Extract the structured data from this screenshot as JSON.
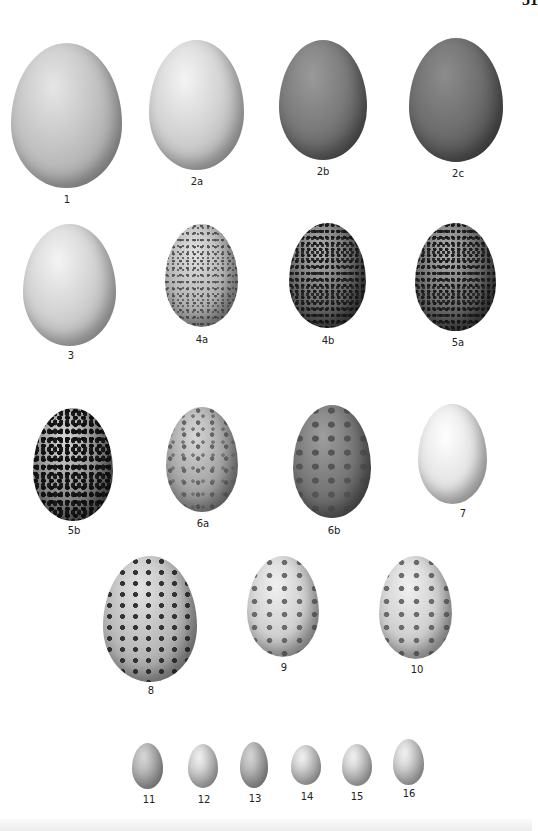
{
  "page": {
    "number": "51"
  },
  "plate": {
    "eggs": [
      {
        "label": "1",
        "left": 11,
        "top": 43,
        "width": 111,
        "height": 145,
        "style": "plain-mid"
      },
      {
        "label": "2a",
        "left": 149,
        "top": 40,
        "width": 95,
        "height": 130,
        "style": "plain-light"
      },
      {
        "label": "2b",
        "left": 279,
        "top": 40,
        "width": 88,
        "height": 120,
        "style": "plain-dark"
      },
      {
        "label": "2c",
        "left": 409,
        "top": 38,
        "width": 94,
        "height": 124,
        "style": "plain-darker"
      },
      {
        "label": "3",
        "left": 23,
        "top": 224,
        "width": 93,
        "height": 122,
        "style": "plain-light"
      },
      {
        "label": "4a",
        "left": 165,
        "top": 224,
        "width": 73,
        "height": 103,
        "style": "speckle-light"
      },
      {
        "label": "4b",
        "left": 289,
        "top": 223,
        "width": 77,
        "height": 105,
        "style": "speckle-dark"
      },
      {
        "label": "5a",
        "left": 415,
        "top": 223,
        "width": 81,
        "height": 108,
        "style": "speckle-dark"
      },
      {
        "label": "5b",
        "left": 33,
        "top": 408,
        "width": 80,
        "height": 113,
        "style": "blotch-dark"
      },
      {
        "label": "6a",
        "left": 166,
        "top": 407,
        "width": 72,
        "height": 105,
        "style": "spotted-mid"
      },
      {
        "label": "6b",
        "left": 293,
        "top": 405,
        "width": 78,
        "height": 113,
        "style": "mottled-dark"
      },
      {
        "label": "7",
        "left": 418,
        "top": 404,
        "width": 69,
        "height": 100,
        "style": "plain-white"
      },
      {
        "label": "8",
        "left": 103,
        "top": 556,
        "width": 94,
        "height": 126,
        "style": "blotch-large"
      },
      {
        "label": "9",
        "left": 247,
        "top": 556,
        "width": 72,
        "height": 101,
        "style": "blotch-pale"
      },
      {
        "label": "10",
        "left": 379,
        "top": 556,
        "width": 73,
        "height": 103,
        "style": "blotch-pale"
      },
      {
        "label": "11",
        "left": 132,
        "top": 743,
        "width": 31,
        "height": 46,
        "style": "small-egg darker"
      },
      {
        "label": "12",
        "left": 188,
        "top": 744,
        "width": 30,
        "height": 44,
        "style": "small-egg"
      },
      {
        "label": "13",
        "left": 240,
        "top": 742,
        "width": 28,
        "height": 46,
        "style": "small-egg darker"
      },
      {
        "label": "14",
        "left": 291,
        "top": 745,
        "width": 30,
        "height": 40,
        "style": "small-egg"
      },
      {
        "label": "15",
        "left": 342,
        "top": 744,
        "width": 30,
        "height": 42,
        "style": "small-egg"
      },
      {
        "label": "16",
        "left": 393,
        "top": 739,
        "width": 31,
        "height": 46,
        "style": "small-egg"
      }
    ],
    "labels": [
      {
        "text": "1",
        "x": 67,
        "y": 194
      },
      {
        "text": "2a",
        "x": 197,
        "y": 176
      },
      {
        "text": "2b",
        "x": 323,
        "y": 166
      },
      {
        "text": "2c",
        "x": 458,
        "y": 168
      },
      {
        "text": "3",
        "x": 71,
        "y": 350
      },
      {
        "text": "4a",
        "x": 202,
        "y": 334
      },
      {
        "text": "4b",
        "x": 328,
        "y": 335
      },
      {
        "text": "5a",
        "x": 458,
        "y": 337
      },
      {
        "text": "5b",
        "x": 74,
        "y": 525
      },
      {
        "text": "6a",
        "x": 203,
        "y": 518
      },
      {
        "text": "6b",
        "x": 334,
        "y": 525
      },
      {
        "text": "7",
        "x": 463,
        "y": 508
      },
      {
        "text": "8",
        "x": 151,
        "y": 685
      },
      {
        "text": "9",
        "x": 284,
        "y": 662
      },
      {
        "text": "10",
        "x": 417,
        "y": 664
      },
      {
        "text": "11",
        "x": 149,
        "y": 794
      },
      {
        "text": "12",
        "x": 204,
        "y": 794
      },
      {
        "text": "13",
        "x": 255,
        "y": 793
      },
      {
        "text": "14",
        "x": 307,
        "y": 791
      },
      {
        "text": "15",
        "x": 357,
        "y": 791
      },
      {
        "text": "16",
        "x": 409,
        "y": 788
      }
    ]
  }
}
